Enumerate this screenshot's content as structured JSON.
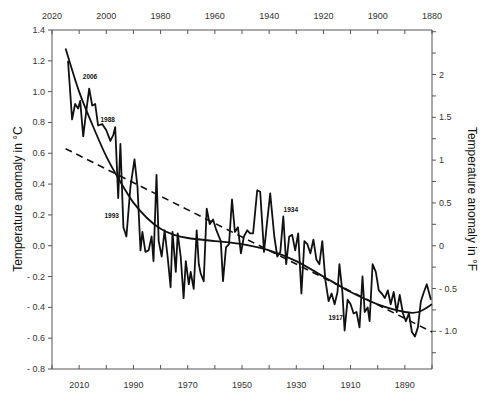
{
  "chart_data": {
    "type": "line",
    "title": "",
    "xlabel": "",
    "ylabel": "Temperature anomaly in °C",
    "ylabel_right": "Temperature anomaly in °F",
    "xlim": [
      2020,
      1880
    ],
    "ylim": [
      -0.8,
      1.4
    ],
    "ylim_right_F": [
      -1.44,
      2.52
    ],
    "x_reversed": true,
    "grid": false,
    "top_ticks": [
      2020,
      2000,
      1980,
      1960,
      1940,
      1920,
      1900,
      1880
    ],
    "top_tick_labels": [
      "2020",
      "2000",
      "1980",
      "1960",
      "1940",
      "1920",
      "1900",
      "1880"
    ],
    "bottom_ticks": [
      2010,
      1990,
      1970,
      1950,
      1930,
      1910,
      1890
    ],
    "bottom_tick_labels": [
      "2010",
      "1990",
      "1970",
      "1950",
      "1930",
      "1910",
      "1890"
    ],
    "left_ticks": [
      1.4,
      1.2,
      1.0,
      0.8,
      0.6,
      0.4,
      0.2,
      0.0,
      -0.2,
      -0.4,
      -0.6,
      -0.8
    ],
    "left_tick_labels": [
      "1.4",
      "1.2",
      "1.0",
      "0.8",
      "0.6",
      "0.4",
      "0.2",
      "0.0",
      "- 0.2",
      "- 0.4",
      "- 0.6",
      "- 0.8"
    ],
    "right_ticks_F": [
      2,
      1.5,
      1,
      0.5,
      0,
      -0.5,
      -1.0
    ],
    "right_tick_labels": [
      "2",
      "1.5",
      "1",
      "0.5",
      "0",
      "- 0.5",
      "- 1.0"
    ],
    "series": [
      {
        "name": "annual anomaly",
        "style": "solid-jagged",
        "x": [
          2014.1,
          2012.6,
          2011.5,
          2010.4,
          2009.6,
          2008.5,
          2007.4,
          2006.3,
          2005.2,
          2004.1,
          2003.0,
          2001.5,
          2000.0,
          1998.5,
          1997.4,
          1996.7,
          1995.6,
          1994.8,
          1993.7,
          1992.6,
          1991.1,
          1989.6,
          1988.5,
          1987.4,
          1986.7,
          1985.6,
          1984.4,
          1983.3,
          1982.6,
          1981.5,
          1980.7,
          1979.6,
          1978.5,
          1977.4,
          1976.3,
          1975.6,
          1974.4,
          1973.7,
          1972.6,
          1971.5,
          1970.7,
          1969.6,
          1968.9,
          1967.8,
          1966.7,
          1965.9,
          1965.2,
          1964.1,
          1963.0,
          1961.9,
          1960.7,
          1959.6,
          1958.5,
          1957.8,
          1957.0,
          1955.9,
          1954.8,
          1953.7,
          1952.6,
          1951.5,
          1950.4,
          1949.3,
          1948.1,
          1947.0,
          1945.9,
          1944.4,
          1943.3,
          1941.9,
          1940.7,
          1939.6,
          1938.1,
          1937.0,
          1935.9,
          1934.8,
          1933.7,
          1932.6,
          1931.5,
          1930.4,
          1929.3,
          1928.1,
          1927.0,
          1925.9,
          1924.8,
          1923.7,
          1922.6,
          1921.5,
          1920.4,
          1919.3,
          1918.1,
          1917.0,
          1915.9,
          1914.8,
          1914.1,
          1913.0,
          1912.2,
          1911.1,
          1910.0,
          1908.9,
          1907.8,
          1906.7,
          1905.6,
          1904.8,
          1903.7,
          1903.0,
          1901.9,
          1900.7,
          1899.6,
          1898.5,
          1897.4,
          1896.3,
          1895.2,
          1894.1,
          1893.0,
          1891.9,
          1890.7,
          1889.6,
          1888.5,
          1887.4,
          1886.3,
          1885.2,
          1884.1,
          1883.0,
          1881.9,
          1880.4
        ],
        "y": [
          1.2,
          0.82,
          0.92,
          0.89,
          0.94,
          0.71,
          0.87,
          1.02,
          0.91,
          0.92,
          0.78,
          0.79,
          0.75,
          0.68,
          0.72,
          0.77,
          0.31,
          0.66,
          0.12,
          0.06,
          0.38,
          0.56,
          0.38,
          -0.03,
          0.09,
          -0.04,
          -0.03,
          0.06,
          -0.1,
          0.46,
          0.03,
          -0.07,
          0.1,
          -0.07,
          -0.27,
          0.09,
          -0.17,
          0.08,
          -0.07,
          -0.34,
          -0.1,
          -0.25,
          -0.17,
          -0.28,
          0.1,
          -0.12,
          -0.18,
          -0.23,
          0.24,
          0.14,
          0.17,
          0.11,
          0.06,
          0.03,
          -0.23,
          -0.01,
          0.01,
          0.3,
          0.09,
          0.12,
          -0.05,
          0.06,
          0.1,
          0.08,
          0.08,
          0.36,
          0.35,
          -0.04,
          0.16,
          0.34,
          0.06,
          -0.07,
          -0.04,
          0.19,
          -0.12,
          0.06,
          0.07,
          -0.03,
          0.08,
          -0.31,
          0.03,
          0.01,
          -0.05,
          0.04,
          -0.09,
          -0.12,
          0.03,
          -0.22,
          -0.36,
          -0.31,
          -0.38,
          -0.3,
          -0.12,
          -0.3,
          -0.55,
          -0.35,
          -0.38,
          -0.44,
          -0.43,
          -0.53,
          -0.2,
          -0.43,
          -0.4,
          -0.49,
          -0.12,
          -0.17,
          -0.29,
          -0.31,
          -0.34,
          -0.29,
          -0.38,
          -0.3,
          -0.43,
          -0.32,
          -0.44,
          -0.49,
          -0.44,
          -0.56,
          -0.59,
          -0.53,
          -0.36,
          -0.3,
          -0.25,
          -0.35
        ]
      },
      {
        "name": "smoothed curve",
        "style": "solid-smooth",
        "x": [
          2015,
          2010,
          2005,
          2000,
          1995,
          1990,
          1985,
          1980,
          1975,
          1970,
          1960,
          1950,
          1940,
          1930,
          1920,
          1910,
          1900,
          1890,
          1885,
          1880
        ],
        "y": [
          1.28,
          1.0,
          0.78,
          0.58,
          0.42,
          0.28,
          0.18,
          0.11,
          0.07,
          0.05,
          0.03,
          0.01,
          -0.03,
          -0.1,
          -0.2,
          -0.3,
          -0.38,
          -0.43,
          -0.43,
          -0.38
        ]
      },
      {
        "name": "linear trend",
        "style": "dashed",
        "x": [
          2015,
          1880
        ],
        "y": [
          0.63,
          -0.56
        ]
      }
    ],
    "annotations": [
      {
        "text": "2006",
        "x": 2006,
        "y": 1.08
      },
      {
        "text": "1988",
        "x": 1999.5,
        "y": 0.8
      },
      {
        "text": "1993",
        "x": 1998,
        "y": 0.18
      },
      {
        "text": "1934",
        "x": 1932,
        "y": 0.22
      },
      {
        "text": "1917",
        "x": 1915.5,
        "y": -0.48
      }
    ]
  }
}
